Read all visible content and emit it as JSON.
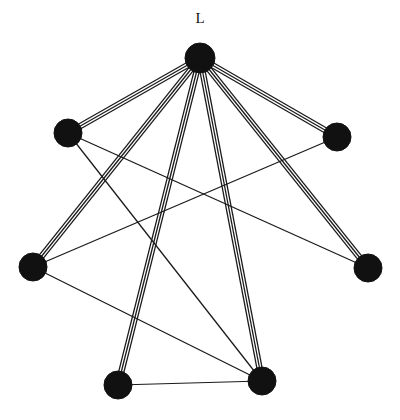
{
  "canvas": {
    "width": 400,
    "height": 420,
    "background": "#ffffff",
    "ink_color": "#1a1a1a",
    "node_fill": "#111111"
  },
  "labels": {
    "hub_label": "L"
  },
  "graph": {
    "node_radius": 14,
    "bundle_multiplicity": 3,
    "bundle_spacing": 2.6,
    "nodes": [
      {
        "id": "hub",
        "name": "hub-node",
        "label": "L",
        "cx": 200,
        "cy": 58,
        "r": 15,
        "label_dx": 0,
        "label_dy": -38
      },
      {
        "id": "upper_left",
        "name": "upper-left-node",
        "label": "",
        "cx": 68,
        "cy": 133,
        "r": 14,
        "label_dx": 0,
        "label_dy": 0
      },
      {
        "id": "upper_right",
        "name": "upper-right-node",
        "label": "",
        "cx": 337,
        "cy": 137,
        "r": 14,
        "label_dx": 0,
        "label_dy": 0
      },
      {
        "id": "left",
        "name": "left-node",
        "label": "",
        "cx": 33,
        "cy": 267,
        "r": 14,
        "label_dx": 0,
        "label_dy": 0
      },
      {
        "id": "right",
        "name": "right-node",
        "label": "",
        "cx": 368,
        "cy": 268,
        "r": 14,
        "label_dx": 0,
        "label_dy": 0
      },
      {
        "id": "bottom_left",
        "name": "bottom-left-node",
        "label": "",
        "cx": 118,
        "cy": 385,
        "r": 14,
        "label_dx": 0,
        "label_dy": 0
      },
      {
        "id": "bottom_right",
        "name": "bottom-right-node",
        "label": "",
        "cx": 262,
        "cy": 381,
        "r": 14,
        "label_dx": 0,
        "label_dy": 0
      }
    ],
    "edges": [
      {
        "name": "edge-hub-upper-left",
        "from": "hub",
        "to": "upper_left",
        "multiplicity": 3,
        "style": "bundle"
      },
      {
        "name": "edge-hub-upper-right",
        "from": "hub",
        "to": "upper_right",
        "multiplicity": 3,
        "style": "bundle"
      },
      {
        "name": "edge-hub-left",
        "from": "hub",
        "to": "left",
        "multiplicity": 3,
        "style": "bundle"
      },
      {
        "name": "edge-hub-right",
        "from": "hub",
        "to": "right",
        "multiplicity": 3,
        "style": "bundle"
      },
      {
        "name": "edge-hub-bottom-left",
        "from": "hub",
        "to": "bottom_left",
        "multiplicity": 3,
        "style": "bundle"
      },
      {
        "name": "edge-hub-bottom-right",
        "from": "hub",
        "to": "bottom_right",
        "multiplicity": 3,
        "style": "bundle"
      },
      {
        "name": "edge-upper-left-right",
        "from": "upper_left",
        "to": "right",
        "multiplicity": 1,
        "style": "thin"
      },
      {
        "name": "edge-upper-left-bottom-right",
        "from": "upper_left",
        "to": "bottom_right",
        "multiplicity": 1,
        "style": "thin"
      },
      {
        "name": "edge-upper-right-left",
        "from": "upper_right",
        "to": "left",
        "multiplicity": 1,
        "style": "thin"
      },
      {
        "name": "edge-left-bottom-right",
        "from": "left",
        "to": "bottom_right",
        "multiplicity": 1,
        "style": "thin"
      },
      {
        "name": "edge-bottom-left-bottom-right",
        "from": "bottom_left",
        "to": "bottom_right",
        "multiplicity": 1,
        "style": "thin"
      }
    ]
  }
}
